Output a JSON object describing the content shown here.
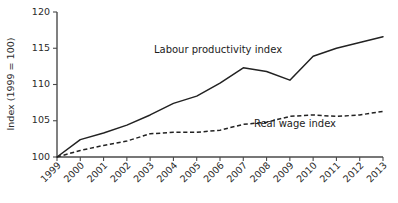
{
  "chart_data": {
    "type": "line",
    "title": "",
    "subtitle": "",
    "xlabel": "",
    "ylabel": "Index (1999 = 100)",
    "grid": false,
    "legend_position": "inline-annotation",
    "xlim": [
      1999,
      2013
    ],
    "ylim": [
      100,
      120
    ],
    "ytick_values": [
      100,
      105,
      110,
      115,
      120
    ],
    "ytick_labels": [
      "100",
      "105",
      "110",
      "115",
      "120"
    ],
    "categories": [
      1999,
      2000,
      2001,
      2002,
      2003,
      2004,
      2005,
      2006,
      2007,
      2008,
      2009,
      2010,
      2011,
      2012,
      2013
    ],
    "xtick_labels": [
      "1999",
      "2000",
      "2001",
      "2002",
      "2003",
      "2004",
      "2005",
      "2006",
      "2007",
      "2008",
      "2009",
      "2010",
      "2011",
      "2012",
      "2013"
    ],
    "series": [
      {
        "name": "Labour productivity index",
        "style": "solid",
        "color": "#222222",
        "annotation": "Labour productivity index",
        "values": [
          100.0,
          102.4,
          103.3,
          104.4,
          105.8,
          107.4,
          108.4,
          110.2,
          112.3,
          111.8,
          110.6,
          113.9,
          115.0,
          115.8,
          116.6
        ]
      },
      {
        "name": "Real wage index",
        "style": "dashed",
        "color": "#222222",
        "annotation": "Real wage index",
        "values": [
          100.0,
          100.9,
          101.6,
          102.2,
          103.2,
          103.4,
          103.4,
          103.7,
          104.5,
          104.8,
          105.6,
          105.8,
          105.6,
          105.8,
          106.3
        ]
      }
    ]
  },
  "annotations": {
    "labour": "Labour productivity index",
    "wage": "Real wage index"
  }
}
